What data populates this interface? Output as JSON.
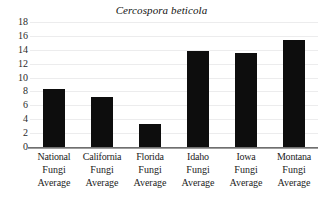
{
  "chart_data": {
    "type": "bar",
    "title": "Cercospora beticola",
    "title_style": "italic",
    "xlabel": "",
    "ylabel": "",
    "ylim": [
      0,
      18
    ],
    "ytick_step": 2,
    "yticks": [
      18,
      16,
      14,
      12,
      10,
      8,
      6,
      4,
      2,
      0
    ],
    "grid": true,
    "legend": "none",
    "bar_color": "#0d0d0d",
    "gridline_color": "#ececed",
    "axis_color": "#6f6f6f",
    "categories": [
      "National Fungi Average",
      "California Fungi Average",
      "Florida Fungi Average",
      "Idaho Fungi Average",
      "Iowa Fungi Average",
      "Montana Fungi Average"
    ],
    "category_lines": [
      [
        "National",
        "Fungi",
        "Average"
      ],
      [
        "California",
        "Fungi",
        "Average"
      ],
      [
        "Florida",
        "Fungi",
        "Average"
      ],
      [
        "Idaho",
        "Fungi",
        "Average"
      ],
      [
        "Iowa",
        "Fungi",
        "Average"
      ],
      [
        "Montana",
        "Fungi",
        "Average"
      ]
    ],
    "values": [
      8.3,
      7.2,
      3.3,
      13.8,
      13.5,
      15.4
    ]
  }
}
